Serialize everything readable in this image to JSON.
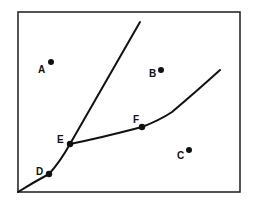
{
  "diagram": {
    "type": "phase-diagram",
    "frame": {
      "x": 18,
      "y": 12,
      "width": 222,
      "height": 180
    },
    "lines": [
      {
        "name": "lower-boundary",
        "description": "from origin through D to E",
        "path": "M18,192 Q34,182 49,174 Q60,162 70,144"
      },
      {
        "name": "steep-boundary",
        "description": "from E up to top",
        "path": "M70,144 L140,22"
      },
      {
        "name": "shallow-boundary",
        "description": "from E through F to upper right",
        "path": "M70,144 Q100,138 142,127 Q160,120 172,112 Q198,90 220,70"
      }
    ],
    "points": [
      {
        "label": "A",
        "x": 51,
        "y": 62,
        "label_x": 38,
        "label_y": 73
      },
      {
        "label": "B",
        "x": 161,
        "y": 70,
        "label_x": 149,
        "label_y": 77
      },
      {
        "label": "C",
        "x": 189,
        "y": 150,
        "label_x": 177,
        "label_y": 159
      },
      {
        "label": "D",
        "x": 49,
        "y": 174,
        "label_x": 36,
        "label_y": 175
      },
      {
        "label": "E",
        "x": 70,
        "y": 144,
        "label_x": 57,
        "label_y": 143
      },
      {
        "label": "F",
        "x": 142,
        "y": 127,
        "label_x": 133,
        "label_y": 123
      }
    ]
  }
}
